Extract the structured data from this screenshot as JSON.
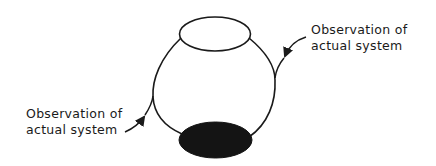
{
  "diagram": {
    "type": "loop-diagram",
    "colors": {
      "stroke": "#1a1a1a",
      "fill_dark": "#141414",
      "background": "#ffffff"
    },
    "nodes": [
      {
        "id": "top-ellipse",
        "shape": "ellipse",
        "filled": false
      },
      {
        "id": "bottom-ellipse",
        "shape": "ellipse",
        "filled": true
      }
    ],
    "labels": {
      "right": {
        "line1": "Observation of",
        "line2": "actual system"
      },
      "left": {
        "line1": "Observation of",
        "line2": "actual system"
      }
    }
  }
}
